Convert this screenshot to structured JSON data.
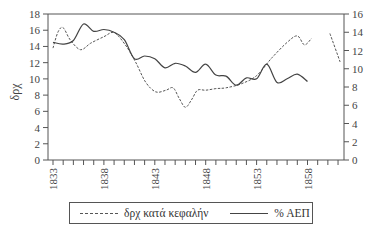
{
  "chart_data": {
    "type": "line",
    "title": "",
    "xlabel": "",
    "ylabel": "δρχ",
    "ylabel_right": "",
    "x_tick_labels": [
      "1833",
      "1838",
      "1843",
      "1848",
      "1853",
      "1858"
    ],
    "xlim": [
      1833,
      1861.5
    ],
    "ylim": [
      0,
      18
    ],
    "ylim_right": [
      0,
      16
    ],
    "y_ticks": [
      0,
      2,
      4,
      6,
      8,
      10,
      12,
      14,
      16,
      18
    ],
    "y_ticks_right": [
      0,
      2,
      4,
      6,
      8,
      10,
      12,
      14,
      16
    ],
    "grid": false,
    "legend_position": "bottom",
    "series": [
      {
        "name": "δρχ κατά κεφαλήν",
        "style": "dashed",
        "axis": "left",
        "x": [
          1833,
          1833.5,
          1834,
          1834.7,
          1835.7,
          1836.7,
          1838,
          1839,
          1840.1,
          1841.1,
          1842.1,
          1843.1,
          1844.1,
          1844.8,
          1845.4,
          1846,
          1846.6,
          1847.2,
          1848,
          1849,
          1850,
          1851.5,
          1853,
          1854.5,
          1856,
          1857,
          1857.7,
          1858.4
        ],
        "values": [
          13.8,
          15.8,
          16.3,
          14.8,
          13.6,
          14.4,
          15.2,
          15.7,
          14.2,
          12.1,
          9.6,
          8.4,
          8.6,
          8.9,
          7.6,
          6.5,
          7.4,
          8.6,
          8.6,
          8.8,
          8.9,
          9.4,
          10.4,
          12.6,
          14.5,
          15.3,
          14.2,
          15.0
        ]
      },
      {
        "name": "δρχ κατά κεφαλήν (later segment)",
        "style": "dashed",
        "axis": "left",
        "x": [
          1860.2,
          1861.2
        ],
        "values": [
          15.6,
          12.1
        ]
      },
      {
        "name": "% ΑΕΠ",
        "style": "solid",
        "axis": "right",
        "x": [
          1833,
          1834,
          1835,
          1836,
          1837,
          1838,
          1839,
          1840,
          1841,
          1842,
          1843,
          1844,
          1845,
          1846,
          1847,
          1848,
          1849,
          1850,
          1851,
          1852,
          1853,
          1854,
          1855,
          1856,
          1857,
          1858
        ],
        "values": [
          12.9,
          12.7,
          13.1,
          14.9,
          14.1,
          14.3,
          14.0,
          13.2,
          11.1,
          11.4,
          11.1,
          10.1,
          10.6,
          10.3,
          9.6,
          10.5,
          9.3,
          9.2,
          8.2,
          9.0,
          8.9,
          10.5,
          8.5,
          8.9,
          9.4,
          8.6
        ]
      }
    ]
  },
  "legend": {
    "items": [
      {
        "label": "δρχ κατά κεφαλήν",
        "style": "dashed"
      },
      {
        "label": "% ΑΕΠ",
        "style": "solid"
      }
    ]
  }
}
